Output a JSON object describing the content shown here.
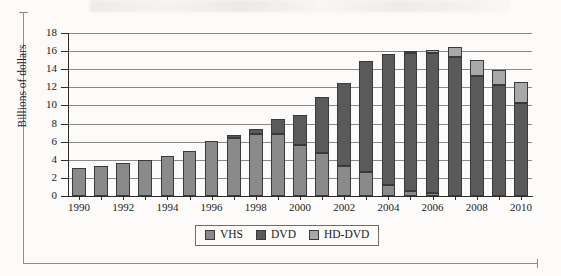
{
  "chart_data": {
    "type": "bar",
    "subtype": "stacked",
    "title": "",
    "xlabel": "",
    "ylabel": "Billions of dollars",
    "ylim": [
      0,
      18
    ],
    "ytick_step": 2,
    "yticks": [
      "0",
      "2",
      "4",
      "6",
      "8",
      "10",
      "12",
      "14",
      "16",
      "18"
    ],
    "grid": true,
    "grid_axis": "y",
    "legend_position": "bottom-center",
    "categories": [
      "1990",
      "1991",
      "1992",
      "1993",
      "1994",
      "1995",
      "1996",
      "1997",
      "1998",
      "1999",
      "2000",
      "2001",
      "2002",
      "2003",
      "2004",
      "2005",
      "2006",
      "2007",
      "2008",
      "2009",
      "2010"
    ],
    "xtick_labels": [
      "1990",
      "1992",
      "1994",
      "1996",
      "1998",
      "2000",
      "2002",
      "2004",
      "2006",
      "2008",
      "2010"
    ],
    "series": [
      {
        "name": "VHS",
        "color": "#8a8a8a",
        "values": [
          3.1,
          3.3,
          3.6,
          4.0,
          4.4,
          5.0,
          6.1,
          6.4,
          6.9,
          6.8,
          5.6,
          4.7,
          3.3,
          2.6,
          1.2,
          0.5,
          0.3,
          0.0,
          0.0,
          0.0,
          0.0
        ]
      },
      {
        "name": "DVD",
        "color": "#5a5a5a",
        "values": [
          0.0,
          0.0,
          0.0,
          0.0,
          0.0,
          0.0,
          0.0,
          0.3,
          0.5,
          1.7,
          3.3,
          6.2,
          9.2,
          12.3,
          14.5,
          15.3,
          15.5,
          15.4,
          13.2,
          12.3,
          10.3
        ]
      },
      {
        "name": "HD-DVD",
        "color": "#a8a8a8",
        "values": [
          0.0,
          0.0,
          0.0,
          0.0,
          0.0,
          0.0,
          0.0,
          0.0,
          0.0,
          0.0,
          0.0,
          0.0,
          0.0,
          0.0,
          0.0,
          0.2,
          0.3,
          1.1,
          1.8,
          1.6,
          2.3
        ]
      }
    ],
    "totals": [
      3.1,
      3.3,
      3.6,
      4.0,
      4.4,
      5.0,
      6.1,
      6.7,
      7.4,
      8.5,
      8.9,
      10.9,
      12.5,
      14.9,
      15.7,
      16.0,
      15.8,
      16.5,
      15.0,
      13.9,
      12.6
    ]
  },
  "legend": {
    "items": [
      {
        "label": "VHS",
        "color": "#8a8a8a"
      },
      {
        "label": "DVD",
        "color": "#5a5a5a"
      },
      {
        "label": "HD-DVD",
        "color": "#a8a8a8"
      }
    ]
  }
}
